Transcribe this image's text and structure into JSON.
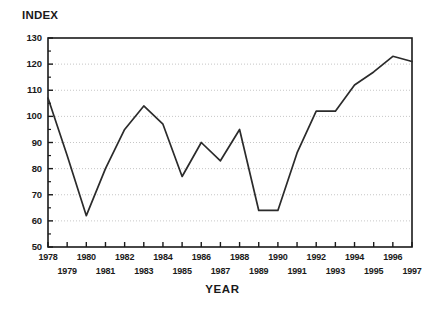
{
  "chart_data": {
    "type": "line",
    "title": "",
    "xlabel": "YEAR",
    "ylabel": "INDEX",
    "ylim": [
      50,
      130
    ],
    "xlim": [
      1978,
      1997
    ],
    "yticks": [
      50,
      60,
      70,
      80,
      90,
      100,
      110,
      120,
      130
    ],
    "grid": true,
    "legend": "none",
    "x": [
      1978,
      1979,
      1980,
      1981,
      1982,
      1983,
      1984,
      1985,
      1986,
      1987,
      1988,
      1989,
      1990,
      1991,
      1992,
      1993,
      1994,
      1995,
      1996,
      1997
    ],
    "categories": [
      "1978",
      "1979",
      "1980",
      "1981",
      "1982",
      "1983",
      "1984",
      "1985",
      "1986",
      "1987",
      "1988",
      "1989",
      "1990",
      "1991",
      "1992",
      "1993",
      "1994",
      "1995",
      "1996",
      "1997"
    ],
    "values": [
      107,
      85,
      62,
      80,
      95,
      104,
      97,
      77,
      90,
      83,
      95,
      64,
      64,
      86,
      102,
      102,
      112,
      117,
      123,
      121
    ],
    "series": [
      {
        "name": "INDEX",
        "values": [
          107,
          85,
          62,
          80,
          95,
          104,
          97,
          77,
          90,
          83,
          95,
          64,
          64,
          86,
          102,
          102,
          112,
          117,
          123,
          121
        ]
      }
    ]
  },
  "axes": {
    "y_title": "INDEX",
    "x_title": "YEAR",
    "y_tick_labels": [
      "130",
      "120",
      "110",
      "100",
      "90",
      "80",
      "70",
      "60",
      "50"
    ],
    "x_tick_labels_top": [
      "1978",
      "1980",
      "1982",
      "1984",
      "1986",
      "1988",
      "1990",
      "1992",
      "1994",
      "1996"
    ],
    "x_tick_labels_bottom": [
      "1979",
      "1981",
      "1983",
      "1985",
      "1987",
      "1989",
      "1991",
      "1993",
      "1995",
      "1997"
    ]
  },
  "style": {
    "line_color": "#2b2b2b",
    "grid_color": "#b8b8b8",
    "axis_color": "#1a1a1a",
    "background": "#ffffff"
  }
}
